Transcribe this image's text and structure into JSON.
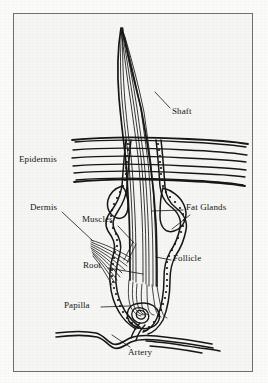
{
  "figure": {
    "type": "anatomical-diagram",
    "background_color": "#f6f6f4",
    "page_color": "#fbfbfa",
    "ink_color": "#151515",
    "frame_color": "#6e6e72",
    "frame": {
      "x": 13,
      "y": 13,
      "width": 240,
      "height": 359
    }
  },
  "labels": [
    {
      "id": "shaft",
      "text": "Shaft",
      "x": 172,
      "y": 110
    },
    {
      "id": "epidermis",
      "text": "Epidermis",
      "x": 19,
      "y": 158
    },
    {
      "id": "fat_glands",
      "text": "Fat Glands",
      "x": 186,
      "y": 206
    },
    {
      "id": "dermis",
      "text": "Dermis",
      "x": 30,
      "y": 206
    },
    {
      "id": "muscles",
      "text": "Muscles",
      "x": 82,
      "y": 218
    },
    {
      "id": "follicle",
      "text": "Follicle",
      "x": 173,
      "y": 257
    },
    {
      "id": "root",
      "text": "Root",
      "x": 83,
      "y": 263
    },
    {
      "id": "papilla",
      "text": "Papilla",
      "x": 64,
      "y": 303
    },
    {
      "id": "artery",
      "text": "Artery",
      "x": 128,
      "y": 350
    }
  ],
  "leader_lines": [
    {
      "id": "shaft-leader",
      "from": [
        155,
        92
      ],
      "to": [
        170,
        110
      ]
    },
    {
      "id": "fat-glands-leader",
      "from": [
        183,
        210
      ],
      "to": [
        157,
        212
      ]
    },
    {
      "id": "fat-glands-leader-2",
      "from": [
        190,
        214
      ],
      "to": [
        168,
        228
      ]
    },
    {
      "id": "dermis-leader",
      "from": [
        61,
        212
      ],
      "to": [
        92,
        240
      ]
    },
    {
      "id": "muscles-leader",
      "from": [
        118,
        226
      ],
      "to": [
        133,
        242
      ]
    },
    {
      "id": "follicle-leader",
      "from": [
        171,
        261
      ],
      "to": [
        155,
        258
      ]
    },
    {
      "id": "root-leader",
      "from": [
        107,
        268
      ],
      "to": [
        142,
        274
      ]
    },
    {
      "id": "papilla-leader",
      "from": [
        100,
        307
      ],
      "to": [
        128,
        306
      ]
    },
    {
      "id": "artery-leader",
      "from": [
        130,
        348
      ],
      "to": [
        112,
        334
      ]
    }
  ],
  "structures": {
    "shaft": {
      "description": "Curving hair shaft rising above the skin surface",
      "tip": [
        121,
        28
      ]
    },
    "epidermis": {
      "description": "Horizontal layered skin lines",
      "line_count": 7,
      "x_start": 72,
      "x_end": 246,
      "y_top": 140,
      "y_bottom": 181
    },
    "follicle": {
      "description": "Beaded follicle wall enclosing the hair root"
    },
    "fat_glands": {
      "description": "Two bulbous sebaceous glands flanking the follicle"
    },
    "muscles": {
      "description": "Fanned arrector pili muscle fibers"
    },
    "papilla": {
      "description": "Dermal papilla inside the hair bulb"
    },
    "artery": {
      "description": "Wavy artery running beneath the bulb"
    }
  }
}
